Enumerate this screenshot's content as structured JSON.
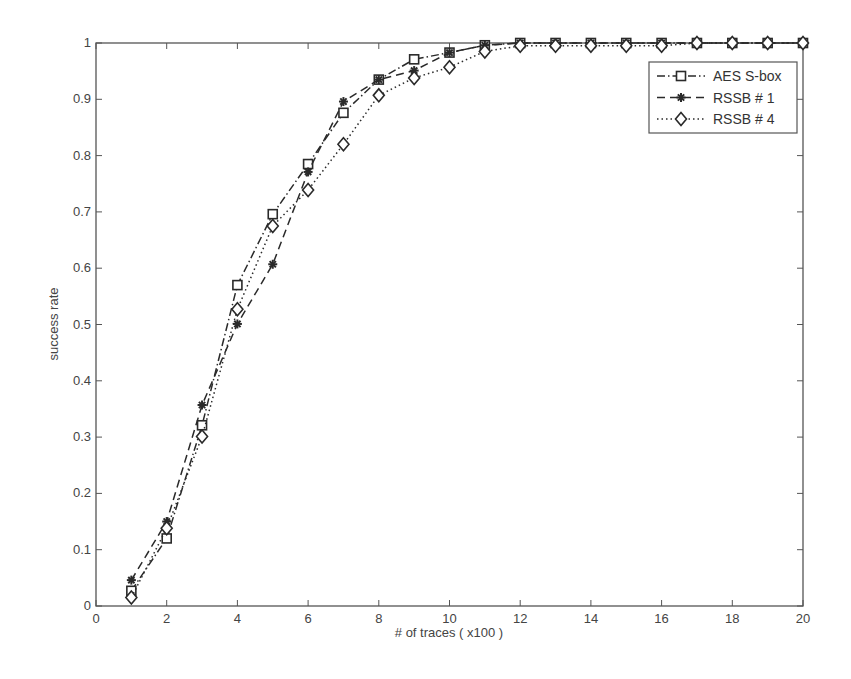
{
  "chart_data": {
    "type": "line",
    "title": "",
    "xlabel": "# of traces ( x100 )",
    "ylabel": "success rate",
    "xlim": [
      0,
      20
    ],
    "ylim": [
      0,
      1
    ],
    "grid": false,
    "legend_position": "upper right",
    "xticks": [
      0,
      2,
      4,
      6,
      8,
      10,
      12,
      14,
      16,
      18,
      20
    ],
    "yticks": [
      0,
      0.1,
      0.2,
      0.3,
      0.4,
      0.5,
      0.6,
      0.7,
      0.8,
      0.9,
      1
    ],
    "ytick_labels": [
      "0",
      "0.1",
      "0.2",
      "0.3",
      "0.4",
      "0.5",
      "0.6",
      "0.7",
      "0.8",
      "0.9",
      "1"
    ],
    "x": [
      1,
      2,
      3,
      4,
      5,
      6,
      7,
      8,
      9,
      10,
      11,
      12,
      13,
      14,
      15,
      16,
      17,
      18,
      19,
      20
    ],
    "series": [
      {
        "name": "AES S-box",
        "marker": "square",
        "line_style": "dash-dot",
        "values": [
          0.027,
          0.12,
          0.321,
          0.57,
          0.696,
          0.785,
          0.876,
          0.935,
          0.971,
          0.983,
          0.996,
          1.0,
          1.0,
          1.0,
          1.0,
          1.0,
          1.0,
          1.0,
          1.0,
          1.0
        ]
      },
      {
        "name": "RSSB # 1",
        "marker": "star",
        "line_style": "dashed",
        "values": [
          0.046,
          0.15,
          0.357,
          0.501,
          0.607,
          0.771,
          0.896,
          0.935,
          0.951,
          0.983,
          0.996,
          1.0,
          1.0,
          1.0,
          1.0,
          1.0,
          1.0,
          1.0,
          1.0,
          1.0
        ]
      },
      {
        "name": "RSSB # 4",
        "marker": "diamond",
        "line_style": "dotted",
        "values": [
          0.015,
          0.138,
          0.301,
          0.527,
          0.675,
          0.739,
          0.82,
          0.907,
          0.938,
          0.957,
          0.985,
          0.995,
          0.995,
          0.995,
          0.995,
          0.995,
          1.0,
          1.0,
          1.0,
          1.0
        ]
      }
    ]
  },
  "colors": {
    "axis": "#555555",
    "series": "#2a2a2a",
    "background": "#ffffff"
  }
}
